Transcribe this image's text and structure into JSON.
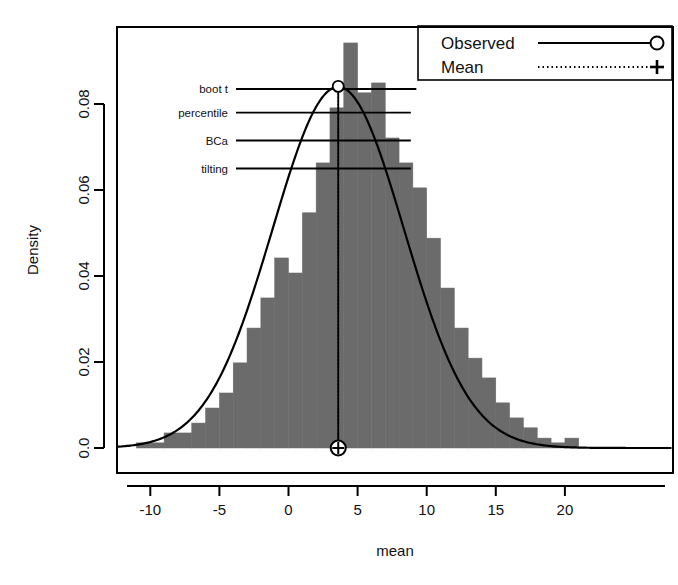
{
  "chart_data": {
    "type": "histogram",
    "title": "",
    "xlabel": "mean",
    "ylabel": "Density",
    "xlim": [
      -11.5,
      21.0
    ],
    "ylim": [
      0.0,
      0.097
    ],
    "grid": false,
    "xticks": [
      -10,
      -5,
      0,
      5,
      10,
      15,
      20
    ],
    "xtick_labels": [
      "-10",
      "-5",
      "0",
      "5",
      "10",
      "15",
      "20"
    ],
    "yticks": [
      0.0,
      0.02,
      0.04,
      0.06,
      0.08
    ],
    "ytick_labels": [
      "0.0",
      "0.02",
      "0.04",
      "0.06",
      "0.08"
    ],
    "bin_width": 1.0,
    "bin_starts": [
      -11,
      -10,
      -9,
      -8,
      -7,
      -6,
      -5,
      -4,
      -3,
      -2,
      -1,
      0,
      1,
      2,
      3,
      4,
      5,
      6,
      7,
      8,
      9,
      10,
      11,
      12,
      13,
      14,
      15,
      16,
      17,
      18,
      19,
      20
    ],
    "bar_heights": [
      0.0012,
      0.0012,
      0.0035,
      0.0035,
      0.0058,
      0.0093,
      0.0128,
      0.0198,
      0.0279,
      0.0349,
      0.0442,
      0.0407,
      0.0547,
      0.0663,
      0.0791,
      0.0942,
      0.0826,
      0.0849,
      0.0721,
      0.0663,
      0.0605,
      0.0488,
      0.0372,
      0.0279,
      0.0209,
      0.0163,
      0.0105,
      0.007,
      0.0047,
      0.0023,
      0.0012,
      0.0023
    ],
    "bar_fill_color": "#6b6b6b",
    "density_curve": {
      "label": "density",
      "color": "#000000",
      "mean": 3.6,
      "sd": 4.75,
      "peak_density": 0.0841
    },
    "observed": {
      "label": "Observed",
      "value": 3.6,
      "marker": "circle",
      "linetype": "solid",
      "color": "#000000"
    },
    "mean": {
      "label": "Mean",
      "value": 3.6,
      "marker": "plus",
      "linetype": "dotted",
      "color": "#000000"
    },
    "confidence_intervals": [
      {
        "name": "boot t",
        "y": 0.0835,
        "lower": -1.65,
        "upper": 9.25
      },
      {
        "name": "percentile",
        "y": 0.078,
        "lower": -1.85,
        "upper": 8.85
      },
      {
        "name": "BCa",
        "y": 0.0715,
        "lower": -1.65,
        "upper": 8.85
      },
      {
        "name": "tilting",
        "y": 0.065,
        "lower": -1.75,
        "upper": 8.85
      }
    ]
  },
  "legend": {
    "entries": [
      {
        "label": "Observed",
        "linetype": "solid",
        "marker": "circle"
      },
      {
        "label": "Mean",
        "linetype": "dotted",
        "marker": "plus"
      }
    ]
  },
  "axes": {
    "y_title": "Density",
    "x_title": "mean"
  },
  "colors": {
    "bar_fill": "#6b6b6b",
    "foreground": "#000000",
    "background": "#ffffff"
  }
}
